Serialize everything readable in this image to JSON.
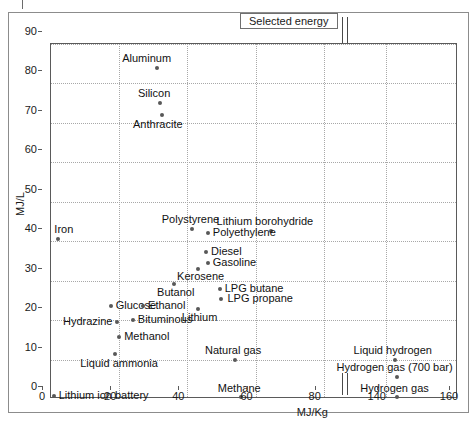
{
  "figure": {
    "title": "Selected energy",
    "xlabel": "MJ/Kg",
    "ylabel": "MJ/L"
  },
  "axes": {
    "y_ticks": [
      "0",
      "10",
      "20",
      "30",
      "40",
      "50",
      "60",
      "70",
      "80",
      "90"
    ],
    "x_ticks": [
      "0",
      "20",
      "40",
      "60",
      "80",
      "140",
      "160"
    ]
  },
  "chart_data": {
    "type": "scatter",
    "title": "Selected energy",
    "xlabel": "MJ/Kg",
    "ylabel": "MJ/L",
    "xlim": [
      0,
      160
    ],
    "ylim": [
      0,
      90
    ],
    "x_axis_break": [
      85,
      135
    ],
    "grid": true,
    "legend": "none",
    "points": [
      {
        "label": "Aluminum",
        "x": 31.0,
        "y": 84.0,
        "lx": -10,
        "ly": -15,
        "align": "center"
      },
      {
        "label": "Silicon",
        "x": 32.0,
        "y": 75.0,
        "lx": -6,
        "ly": -15,
        "align": "center"
      },
      {
        "label": "Anthracite",
        "x": 32.5,
        "y": 72.0,
        "lx": -4,
        "ly": 4,
        "align": "center"
      },
      {
        "label": "Iron",
        "x": 2.0,
        "y": 40.5,
        "lx": 6,
        "ly": -15,
        "align": "center"
      },
      {
        "label": "Polystyrene",
        "x": 41.5,
        "y": 43.2,
        "lx": -2,
        "ly": -15,
        "align": "center"
      },
      {
        "label": "Lithium borohydride",
        "x": 64.5,
        "y": 42.7,
        "lx": -6,
        "ly": -15,
        "align": "center"
      },
      {
        "label": "Polyethylene",
        "x": 46.0,
        "y": 42.0,
        "lx": 5,
        "ly": -6,
        "align": "left"
      },
      {
        "label": "Diesel",
        "x": 45.5,
        "y": 37.3,
        "lx": 5,
        "ly": -6,
        "align": "left"
      },
      {
        "label": "Gasoline",
        "x": 46.0,
        "y": 34.6,
        "lx": 5,
        "ly": -6,
        "align": "left"
      },
      {
        "label": "Kerosene",
        "x": 43.0,
        "y": 33.0,
        "lx": 3,
        "ly": 2,
        "align": "center"
      },
      {
        "label": "Butanol",
        "x": 36.0,
        "y": 29.2,
        "lx": 2,
        "ly": 3,
        "align": "center"
      },
      {
        "label": "LPG butane",
        "x": 49.5,
        "y": 28.0,
        "lx": 5,
        "ly": -6,
        "align": "left"
      },
      {
        "label": "LPG propane",
        "x": 50.0,
        "y": 25.4,
        "lx": 6,
        "ly": -6,
        "align": "left"
      },
      {
        "label": "Glucose",
        "x": 17.5,
        "y": 23.7,
        "lx": 5,
        "ly": -6,
        "align": "left"
      },
      {
        "label": "Ethanol",
        "x": 27.0,
        "y": 23.7,
        "lx": 5,
        "ly": -6,
        "align": "left"
      },
      {
        "label": "Lithium",
        "x": 43.0,
        "y": 22.8,
        "lx": 2,
        "ly": 3,
        "align": "center"
      },
      {
        "label": "Bituminous",
        "x": 24.0,
        "y": 20.0,
        "lx": 5,
        "ly": -6,
        "align": "left"
      },
      {
        "label": "Hydrazine",
        "x": 19.5,
        "y": 19.4,
        "lx": -5,
        "ly": -6,
        "align": "right"
      },
      {
        "label": "Methanol",
        "x": 20.0,
        "y": 15.7,
        "lx": 5,
        "ly": -6,
        "align": "left"
      },
      {
        "label": "Liquid ammonia",
        "x": 18.8,
        "y": 11.5,
        "lx": 4,
        "ly": 4,
        "align": "center"
      },
      {
        "label": "Natural gas",
        "x": 54.0,
        "y": 10.0,
        "lx": -2,
        "ly": -15,
        "align": "center"
      },
      {
        "label": "Liquid hydrogen",
        "x": 142.5,
        "y": 10.0,
        "lx": -2,
        "ly": -15,
        "align": "center"
      },
      {
        "label": "Hydrogen gas (700 bar)",
        "x": 143.0,
        "y": 5.6,
        "lx": -2,
        "ly": -15,
        "align": "center"
      },
      {
        "label": "Lithium ion battery",
        "x": 0.8,
        "y": 0.7,
        "lx": 5,
        "ly": -6,
        "align": "left"
      },
      {
        "label": "Methane",
        "x": 55.8,
        "y": 0.4,
        "lx": -2,
        "ly": -14,
        "align": "center"
      },
      {
        "label": "Hydrogen gas",
        "x": 143.0,
        "y": 0.4,
        "lx": -2,
        "ly": -14,
        "align": "center"
      }
    ]
  },
  "colors": {
    "point": "#585858",
    "grid": "#a8a8a8",
    "axis": "#5a5a5a",
    "frame": "#8c8c8c",
    "text": "#111111"
  }
}
